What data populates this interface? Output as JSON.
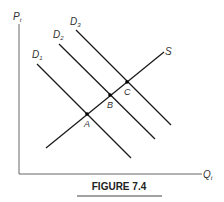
{
  "figure": {
    "caption": "FIGURE 7.4",
    "axes": {
      "y_label": "P",
      "y_label_sub": "t",
      "x_label": "Q",
      "x_label_sub": "t"
    },
    "curves": {
      "supply": {
        "label": "S"
      },
      "demand": [
        {
          "label": "D",
          "sub": "1"
        },
        {
          "label": "D",
          "sub": "2"
        },
        {
          "label": "D",
          "sub": "3"
        }
      ]
    },
    "points": [
      {
        "label": "A"
      },
      {
        "label": "B"
      },
      {
        "label": "C"
      }
    ],
    "colors": {
      "line": "#1a1a1a",
      "axis": "#666666",
      "text": "#333333"
    }
  }
}
